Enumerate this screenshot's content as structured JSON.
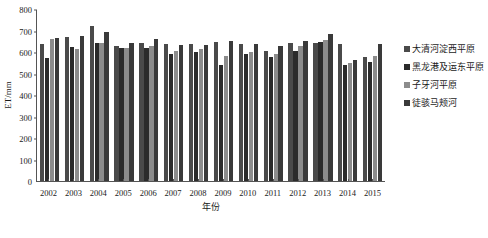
{
  "chart_data": {
    "type": "bar",
    "title": "",
    "xlabel": "年份",
    "ylabel": "ET/mm",
    "ylim": [
      0,
      800
    ],
    "yticks": [
      0,
      100,
      200,
      300,
      400,
      500,
      600,
      700,
      800
    ],
    "grid": false,
    "legend_position": "right",
    "categories": [
      "2002",
      "2003",
      "2004",
      "2005",
      "2006",
      "2007",
      "2008",
      "2009",
      "2010",
      "2011",
      "2012",
      "2013",
      "2014",
      "2015"
    ],
    "series": [
      {
        "name": "大清河淀西平原",
        "color": "#4a4a4a",
        "values": [
          638,
          672,
          722,
          630,
          643,
          638,
          639,
          646,
          638,
          607,
          640,
          640,
          638,
          575
        ]
      },
      {
        "name": "黑龙港及运东平原",
        "color": "#2b2b2b",
        "values": [
          573,
          625,
          640,
          618,
          621,
          592,
          600,
          540,
          592,
          576,
          607,
          648,
          540,
          555
        ]
      },
      {
        "name": "子牙河平原",
        "color": "#8c8c8c",
        "values": [
          660,
          616,
          640,
          620,
          627,
          607,
          616,
          583,
          600,
          592,
          630,
          655,
          548,
          580
        ]
      },
      {
        "name": "徒骇马颊河",
        "color": "#3a3a3a",
        "values": [
          663,
          676,
          695,
          640,
          660,
          634,
          633,
          651,
          635,
          630,
          650,
          682,
          562,
          635
        ]
      }
    ]
  },
  "legend": {
    "items": [
      {
        "label": "大清河淀西平原",
        "color": "#4a4a4a"
      },
      {
        "label": "黑龙港及运东平原",
        "color": "#2b2b2b"
      },
      {
        "label": "子牙河平原",
        "color": "#8c8c8c"
      },
      {
        "label": "徒骇马颊河",
        "color": "#3a3a3a"
      }
    ]
  }
}
